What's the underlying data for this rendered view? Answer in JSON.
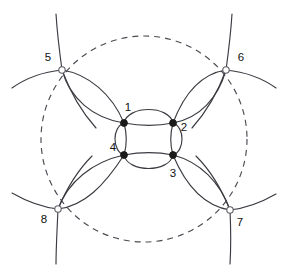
{
  "figure": {
    "canvas": {
      "width": 286,
      "height": 274
    },
    "background_color": "#ffffff"
  },
  "colors": {
    "arc_stroke": "#3b3b42",
    "dashed_stroke": "#4a4a52",
    "filled_vertex": "#1a1a1a",
    "open_vertex_fill": "#ffffff",
    "open_vertex_stroke": "#5d5d66",
    "label_text": "#111111"
  },
  "chart_data": {
    "type": "diagram",
    "center": {
      "x": 148,
      "y": 139
    },
    "boundary": {
      "name": "dashed-bounding-circle",
      "cx": 144,
      "cy": 139,
      "r": 103,
      "style": "dashed",
      "dash_pattern": "6 5"
    },
    "vertices": [
      {
        "id": 1,
        "label": "1",
        "x": 124,
        "y": 123,
        "marker": "filled",
        "group": "inner",
        "label_x": 128,
        "label_y": 108,
        "label_anchor": "middle"
      },
      {
        "id": 2,
        "label": "2",
        "x": 173,
        "y": 123,
        "marker": "filled",
        "group": "inner",
        "label_x": 184,
        "label_y": 128,
        "label_anchor": "middle"
      },
      {
        "id": 3,
        "label": "3",
        "x": 173,
        "y": 155,
        "marker": "filled",
        "group": "inner",
        "label_x": 173,
        "label_y": 174,
        "label_anchor": "middle"
      },
      {
        "id": 4,
        "label": "4",
        "x": 124,
        "y": 155,
        "marker": "filled",
        "group": "inner",
        "label_x": 113,
        "label_y": 148,
        "label_anchor": "middle"
      },
      {
        "id": 5,
        "label": "5",
        "x": 62,
        "y": 70,
        "marker": "open",
        "group": "outer",
        "label_x": 48,
        "label_y": 58,
        "label_anchor": "middle"
      },
      {
        "id": 6,
        "label": "6",
        "x": 226,
        "y": 70,
        "marker": "open",
        "group": "outer",
        "label_x": 241,
        "label_y": 58,
        "label_anchor": "middle"
      },
      {
        "id": 7,
        "label": "7",
        "x": 230,
        "y": 210,
        "marker": "open",
        "group": "outer",
        "label_x": 240,
        "label_y": 223,
        "label_anchor": "middle"
      },
      {
        "id": 8,
        "label": "8",
        "x": 58,
        "y": 209,
        "marker": "open",
        "group": "outer",
        "label_x": 44,
        "label_y": 220,
        "label_anchor": "middle"
      }
    ],
    "marker_radii": {
      "filled": 3.4,
      "open": 3.2
    },
    "edges": [
      {
        "from": 1,
        "to": 2,
        "kind": "lens-pair",
        "note": "inner top edge, arcs bulge up and down"
      },
      {
        "from": 2,
        "to": 3,
        "kind": "lens-pair",
        "note": "inner right edge, arcs bulge left and right"
      },
      {
        "from": 3,
        "to": 4,
        "kind": "lens-pair",
        "note": "inner bottom edge, arcs bulge up and down"
      },
      {
        "from": 4,
        "to": 1,
        "kind": "lens-pair",
        "note": "inner left edge, arcs bulge left and right"
      },
      {
        "from": 5,
        "to": 1,
        "kind": "lens-pair",
        "note": "upper-left diagonal lens"
      },
      {
        "from": 6,
        "to": 2,
        "kind": "lens-pair",
        "note": "upper-right diagonal lens"
      },
      {
        "from": 7,
        "to": 3,
        "kind": "lens-pair",
        "note": "lower-right diagonal lens"
      },
      {
        "from": 8,
        "to": 4,
        "kind": "lens-pair",
        "note": "lower-left diagonal lens"
      }
    ],
    "outer_tails": {
      "count_per_open_vertex": 4,
      "note": "each open vertex emits arcs continuing outward beyond the dashed circle"
    },
    "counts": {
      "filled_vertices": 4,
      "open_vertices": 8,
      "total_labels": 8
    },
    "labels": [
      "1",
      "2",
      "3",
      "4",
      "5",
      "6",
      "7",
      "8"
    ]
  }
}
